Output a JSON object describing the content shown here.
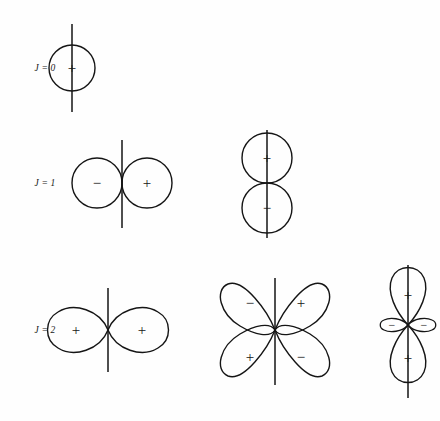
{
  "figure": {
    "background_color": "#fefefe",
    "stroke_color": "#151515",
    "width": 440,
    "height": 421
  },
  "row_labels": [
    {
      "id": "j0",
      "text": "J = 0",
      "x": 45,
      "y": 68
    },
    {
      "id": "j1",
      "text": "J = 1",
      "x": 45,
      "y": 183
    },
    {
      "id": "j2",
      "text": "J = 2",
      "x": 45,
      "y": 330
    }
  ],
  "rows": [
    {
      "label": "J = 0",
      "j_value": 0,
      "diagrams": [
        {
          "name": "monopole-circle",
          "kind": "single-circle",
          "center_x": 72,
          "center_y": 68,
          "radius": 23,
          "axis_top": 24,
          "axis_bottom": 112,
          "lobes": [
            {
              "sign": "+",
              "x": 72,
              "y": 68
            }
          ]
        }
      ]
    },
    {
      "label": "J = 1",
      "j_value": 1,
      "diagrams": [
        {
          "name": "dipole-horizontal",
          "kind": "two-circles-horizontal",
          "center_x": 122,
          "center_y": 183,
          "radius": 25,
          "axis_top": 140,
          "axis_bottom": 228,
          "lobes": [
            {
              "sign": "−",
              "x": 97,
              "y": 183
            },
            {
              "sign": "+",
              "x": 147,
              "y": 183
            }
          ]
        },
        {
          "name": "dipole-vertical",
          "kind": "two-circles-vertical",
          "center_x": 267,
          "center_y": 183,
          "radius": 25,
          "axis_top": 130,
          "axis_bottom": 238,
          "lobes": [
            {
              "sign": "+",
              "x": 267,
              "y": 158
            },
            {
              "sign": "−",
              "x": 267,
              "y": 208
            }
          ]
        }
      ]
    },
    {
      "label": "J = 2",
      "j_value": 2,
      "diagrams": [
        {
          "name": "quadrupole-horizontal-figure-eight",
          "kind": "figure-eight-horizontal",
          "center_x": 108,
          "center_y": 330,
          "lobe_length": 55,
          "lobe_width": 27,
          "axis_top": 288,
          "axis_bottom": 372,
          "lobes": [
            {
              "sign": "+",
              "x": 74,
              "y": 330
            },
            {
              "sign": "+",
              "x": 142,
              "y": 330
            }
          ]
        },
        {
          "name": "quadrupole-cloverleaf",
          "kind": "four-lobe-cloverleaf",
          "center_x": 275,
          "center_y": 330,
          "lobe_length": 58,
          "lobe_width": 30,
          "axis_top": 278,
          "axis_bottom": 385,
          "lobes": [
            {
              "sign": "−",
              "x": 249,
              "y": 303
            },
            {
              "sign": "+",
              "x": 301,
              "y": 303
            },
            {
              "sign": "+",
              "x": 249,
              "y": 357
            },
            {
              "sign": "−",
              "x": 301,
              "y": 357
            }
          ]
        },
        {
          "name": "quadrupole-dz2",
          "kind": "dz2-two-lobes-with-torus",
          "center_x": 408,
          "center_y": 325,
          "lobe_length": 55,
          "lobe_width": 25,
          "small_lobe_length": 22,
          "small_lobe_width": 9,
          "axis_top": 265,
          "axis_bottom": 398,
          "lobes": [
            {
              "sign": "+",
              "x": 408,
              "y": 295
            },
            {
              "sign": "+",
              "x": 408,
              "y": 358
            },
            {
              "sign": "−",
              "x": 391,
              "y": 325
            },
            {
              "sign": "−",
              "x": 425,
              "y": 325
            }
          ]
        }
      ]
    }
  ]
}
